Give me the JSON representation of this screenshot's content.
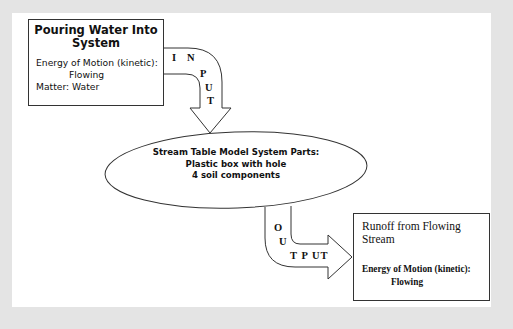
{
  "diagram": {
    "input_box": {
      "title": "Pouring Water Into System",
      "energy_label": "Energy of Motion (kinetic):",
      "energy_value": "Flowing",
      "matter": "Matter:  Water"
    },
    "input_arrow": {
      "letters": [
        "I",
        "N",
        "P",
        "U",
        "T"
      ]
    },
    "system": {
      "title": "Stream Table Model System Parts:",
      "part1": "Plastic box with hole",
      "part2": "4 soil components"
    },
    "output_arrow": {
      "letters": [
        "O",
        "U",
        "T P UT"
      ]
    },
    "output_box": {
      "title": "Runoff from Flowing Stream",
      "energy_label": "Energy of Motion (kinetic):",
      "energy_value": "Flowing"
    },
    "colors": {
      "background": "#e4e4e4",
      "panel": "#ffffff",
      "stroke": "#333333"
    }
  }
}
